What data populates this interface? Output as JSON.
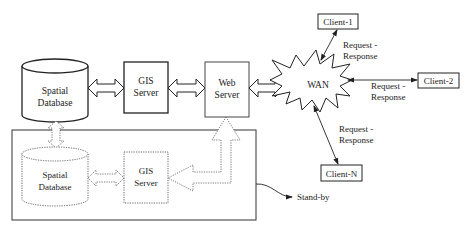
{
  "diagram": {
    "nodes": {
      "spatial_db": {
        "line1": "Spatial",
        "line2": "Database"
      },
      "gis_server": {
        "line1": "GIS",
        "line2": "Server"
      },
      "web_server": {
        "line1": "Web",
        "line2": "Server"
      },
      "wan": {
        "label": "WAN"
      },
      "client_1": {
        "label": "Client-1"
      },
      "client_2": {
        "label": "Client-2"
      },
      "client_n": {
        "label": "Client-N"
      },
      "standby_db": {
        "line1": "Spatial",
        "line2": "Database"
      },
      "standby_gis": {
        "line1": "GIS",
        "line2": "Server"
      }
    },
    "edge_labels": {
      "client_1": {
        "line1": "Request -",
        "line2": "Response"
      },
      "client_2": {
        "line1": "Request -",
        "line2": "Response"
      },
      "client_n": {
        "line1": "Request -",
        "line2": "Response"
      }
    },
    "standby_label": "Stand-by",
    "colors": {
      "stroke": "#333333",
      "dotted_stroke": "#555555",
      "background": "#ffffff"
    }
  }
}
